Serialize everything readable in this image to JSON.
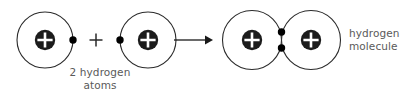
{
  "figure": {
    "background_color": "#ffffff",
    "stroke_color": "#1a1a1a",
    "nucleus_color": "#1a1a1a",
    "electron_color": "#000000",
    "text_color": "#5a5a5a",
    "width": 418,
    "height": 97
  },
  "reactants": {
    "atom_left": {
      "name": "hydrogen atom",
      "orbit": {
        "cx": 45,
        "cy": 40,
        "r": 28
      },
      "nucleus": {
        "cx": 45,
        "cy": 40,
        "r": 10,
        "charge_symbol": "+"
      },
      "electron": {
        "cx": 73,
        "cy": 40,
        "r": 3.6
      }
    },
    "plus_operator": {
      "symbol": "+",
      "cx": 96,
      "cy": 40
    },
    "atom_right": {
      "name": "hydrogen atom",
      "orbit": {
        "cx": 148,
        "cy": 40,
        "r": 28
      },
      "nucleus": {
        "cx": 148,
        "cy": 40,
        "r": 10,
        "charge_symbol": "+"
      },
      "electron": {
        "cx": 120,
        "cy": 40,
        "r": 3.6
      }
    },
    "caption": {
      "line1": "2 hydrogen",
      "line2": "atoms"
    }
  },
  "reaction_arrow": {
    "x_start": 174,
    "x_end": 213,
    "y": 40,
    "direction": "right"
  },
  "product": {
    "molecule": {
      "name": "hydrogen molecule",
      "orbit_left": {
        "cx": 252,
        "cy": 40,
        "r": 29.5
      },
      "orbit_right": {
        "cx": 311,
        "cy": 40,
        "r": 29.5
      },
      "nucleus_left": {
        "cx": 252,
        "cy": 40,
        "r": 10,
        "charge_symbol": "+"
      },
      "nucleus_right": {
        "cx": 311,
        "cy": 40,
        "r": 10,
        "charge_symbol": "+"
      },
      "shared_electrons": [
        {
          "cx": 281.5,
          "cy": 32,
          "r": 3.6
        },
        {
          "cx": 281.5,
          "cy": 48,
          "r": 3.6
        }
      ]
    },
    "caption": {
      "line1": "hydrogen",
      "line2": "molecule"
    }
  }
}
